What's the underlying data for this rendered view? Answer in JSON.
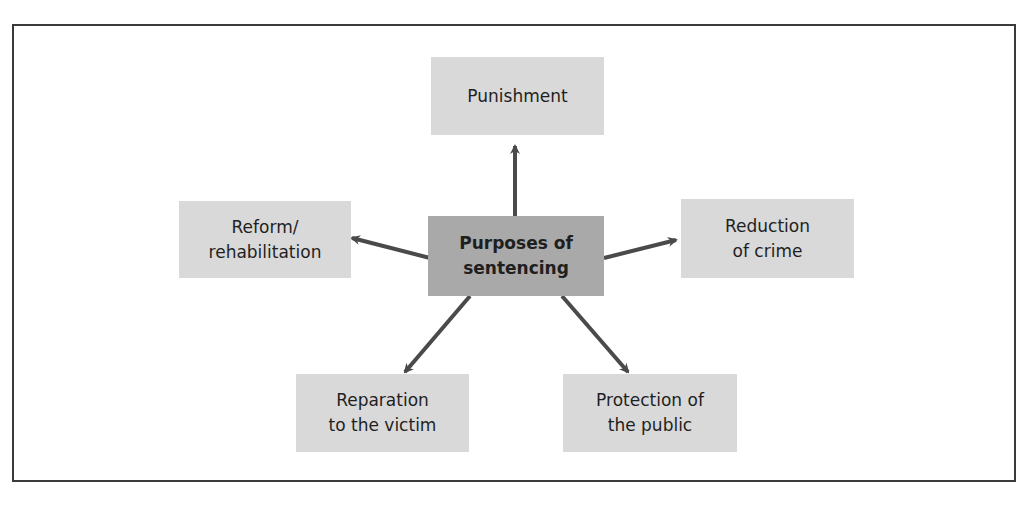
{
  "diagram": {
    "type": "hub-and-spoke",
    "center": {
      "label_line1": "Purposes of",
      "label_line2": "sentencing"
    },
    "nodes": [
      {
        "id": "punishment",
        "line1": "Punishment",
        "line2": ""
      },
      {
        "id": "reform",
        "line1": "Reform/",
        "line2": "rehabilitation"
      },
      {
        "id": "reduction",
        "line1": "Reduction",
        "line2": "of crime"
      },
      {
        "id": "reparation",
        "line1": "Reparation",
        "line2": "to the victim"
      },
      {
        "id": "protection",
        "line1": "Protection of",
        "line2": "the public"
      }
    ],
    "colors": {
      "center_fill": "#a9a9a9",
      "node_fill": "#d9d9d9",
      "arrow": "#4a4a4a",
      "frame": "#3a3a3a"
    }
  }
}
